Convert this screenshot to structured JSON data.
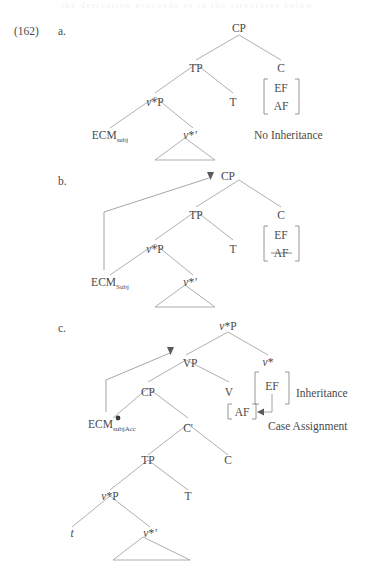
{
  "document": {
    "example_number": "(162)",
    "page_bleed_text": "the derivation proceeds as in the structures below"
  },
  "items": [
    {
      "letter": "a.",
      "annotation": "No Inheritance",
      "nodes": {
        "cp": "CP",
        "tp": "TP",
        "c": "C",
        "vstarp": "v*P",
        "t": "T",
        "ecm": "ECM",
        "ecm_sub": "subj",
        "vstarbar": "v*'"
      },
      "features": [
        "EF",
        "AF"
      ],
      "features_struck": []
    },
    {
      "letter": "b.",
      "annotation": "",
      "nodes": {
        "cp": "CP",
        "tp": "TP",
        "c": "C",
        "vstarp": "v*P",
        "t": "T",
        "ecm": "ECM",
        "ecm_sub": "Subj",
        "vstarbar": "v*'"
      },
      "features": [
        "EF",
        "AF"
      ],
      "features_struck": [
        "AF"
      ]
    },
    {
      "letter": "c.",
      "annotation_inheritance": "Inheritance",
      "annotation_case": "Case Assignment",
      "nodes": {
        "vstarp_top": "v*P",
        "vp": "VP",
        "vstar": "v*",
        "cp": "CP",
        "v": "V",
        "ecm": "ECM",
        "ecm_sub": "subjAcc",
        "cbar": "C'",
        "tp": "TP",
        "c": "C",
        "vstarp": "v*P",
        "t": "T",
        "trace": "t",
        "vstarbar": "v*'"
      },
      "features_upper": [
        "EF"
      ],
      "features_lower": [
        "AF"
      ]
    }
  ],
  "colors": {
    "text": "#4a4a4a",
    "line": "#9a9a9a",
    "arrow": "#5a5a5a",
    "background": "#ffffff"
  }
}
